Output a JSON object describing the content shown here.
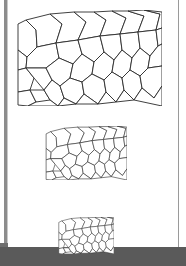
{
  "document": {
    "title": "Polygonal mesh at three resolutions",
    "background_color": "#ffffff",
    "ink_color": "#2a2a2a",
    "page_width": 186,
    "page_height": 266
  },
  "scan_artifacts": {
    "left_edge_label": "scan-left-dark-edge",
    "left_edge_color": "#8c8c8c",
    "right_edge_label": "scan-right-thin-line",
    "right_edge_color": "#9a9a9a",
    "bottom_band_label": "scan-bottom-dark-band",
    "bottom_band_color": "#5a5a5a"
  },
  "figures": [
    {
      "id": "fig-large",
      "name": "mesh-large",
      "scale_percent": 100,
      "x": 16,
      "y": 10,
      "width": 146,
      "height": 96,
      "stroke_width": 0.9,
      "stroke_color": "#2a2a2a",
      "fill_color": "#ffffff"
    },
    {
      "id": "fig-medium",
      "name": "mesh-medium",
      "scale_percent": 56,
      "x": 45,
      "y": 126,
      "width": 82,
      "height": 54,
      "stroke_width": 0.6,
      "stroke_color": "#4a4a4a",
      "fill_color": "#ffffff"
    },
    {
      "id": "fig-small",
      "name": "mesh-small",
      "scale_percent": 38,
      "x": 58,
      "y": 217,
      "width": 56,
      "height": 37,
      "stroke_width": 0.5,
      "stroke_color": "#5a5a5a",
      "fill_color": "#ffffff"
    }
  ],
  "chart_data": {
    "type": "diagram",
    "domain_extent": [
      0,
      146,
      0,
      96
    ],
    "polygon_count": 38,
    "polygons": [
      [
        [
          2,
          14
        ],
        [
          2,
          40
        ],
        [
          11,
          47
        ],
        [
          21,
          37
        ],
        [
          20,
          20
        ],
        [
          10,
          10
        ]
      ],
      [
        [
          10,
          10
        ],
        [
          20,
          20
        ],
        [
          21,
          37
        ],
        [
          40,
          33
        ],
        [
          46,
          14
        ],
        [
          34,
          4
        ]
      ],
      [
        [
          34,
          4
        ],
        [
          46,
          14
        ],
        [
          40,
          33
        ],
        [
          62,
          30
        ],
        [
          70,
          12
        ],
        [
          58,
          2
        ]
      ],
      [
        [
          58,
          2
        ],
        [
          70,
          12
        ],
        [
          62,
          30
        ],
        [
          84,
          26
        ],
        [
          90,
          10
        ],
        [
          78,
          2
        ]
      ],
      [
        [
          78,
          2
        ],
        [
          90,
          10
        ],
        [
          84,
          26
        ],
        [
          104,
          24
        ],
        [
          110,
          8
        ],
        [
          96,
          1
        ]
      ],
      [
        [
          96,
          1
        ],
        [
          110,
          8
        ],
        [
          104,
          24
        ],
        [
          122,
          22
        ],
        [
          128,
          6
        ],
        [
          112,
          1
        ]
      ],
      [
        [
          112,
          1
        ],
        [
          128,
          6
        ],
        [
          122,
          22
        ],
        [
          140,
          20
        ],
        [
          144,
          4
        ],
        [
          128,
          0
        ]
      ],
      [
        [
          128,
          0
        ],
        [
          144,
          4
        ],
        [
          140,
          20
        ],
        [
          146,
          18
        ],
        [
          146,
          2
        ]
      ],
      [
        [
          2,
          40
        ],
        [
          11,
          47
        ],
        [
          10,
          58
        ],
        [
          2,
          60
        ]
      ],
      [
        [
          11,
          47
        ],
        [
          21,
          37
        ],
        [
          40,
          33
        ],
        [
          43,
          48
        ],
        [
          30,
          58
        ],
        [
          10,
          58
        ]
      ],
      [
        [
          40,
          33
        ],
        [
          62,
          30
        ],
        [
          66,
          44
        ],
        [
          57,
          54
        ],
        [
          43,
          48
        ]
      ],
      [
        [
          62,
          30
        ],
        [
          84,
          26
        ],
        [
          88,
          42
        ],
        [
          78,
          52
        ],
        [
          66,
          44
        ]
      ],
      [
        [
          84,
          26
        ],
        [
          104,
          24
        ],
        [
          106,
          40
        ],
        [
          98,
          50
        ],
        [
          88,
          42
        ]
      ],
      [
        [
          104,
          24
        ],
        [
          122,
          22
        ],
        [
          124,
          38
        ],
        [
          116,
          48
        ],
        [
          106,
          40
        ]
      ],
      [
        [
          122,
          22
        ],
        [
          140,
          20
        ],
        [
          142,
          36
        ],
        [
          134,
          46
        ],
        [
          124,
          38
        ]
      ],
      [
        [
          140,
          20
        ],
        [
          146,
          18
        ],
        [
          146,
          34
        ],
        [
          142,
          36
        ]
      ],
      [
        [
          2,
          60
        ],
        [
          10,
          58
        ],
        [
          18,
          68
        ],
        [
          14,
          80
        ],
        [
          2,
          82
        ]
      ],
      [
        [
          10,
          58
        ],
        [
          30,
          58
        ],
        [
          36,
          70
        ],
        [
          28,
          80
        ],
        [
          18,
          68
        ]
      ],
      [
        [
          30,
          58
        ],
        [
          43,
          48
        ],
        [
          57,
          54
        ],
        [
          54,
          68
        ],
        [
          44,
          76
        ],
        [
          36,
          70
        ]
      ],
      [
        [
          57,
          54
        ],
        [
          66,
          44
        ],
        [
          78,
          52
        ],
        [
          76,
          64
        ],
        [
          66,
          72
        ],
        [
          54,
          68
        ]
      ],
      [
        [
          78,
          52
        ],
        [
          88,
          42
        ],
        [
          98,
          50
        ],
        [
          96,
          62
        ],
        [
          88,
          70
        ],
        [
          76,
          64
        ]
      ],
      [
        [
          98,
          50
        ],
        [
          106,
          40
        ],
        [
          116,
          48
        ],
        [
          114,
          60
        ],
        [
          106,
          68
        ],
        [
          96,
          62
        ]
      ],
      [
        [
          116,
          48
        ],
        [
          124,
          38
        ],
        [
          134,
          46
        ],
        [
          132,
          58
        ],
        [
          124,
          66
        ],
        [
          114,
          60
        ]
      ],
      [
        [
          134,
          46
        ],
        [
          142,
          36
        ],
        [
          146,
          34
        ],
        [
          146,
          56
        ],
        [
          132,
          58
        ]
      ],
      [
        [
          2,
          82
        ],
        [
          14,
          80
        ],
        [
          20,
          92
        ],
        [
          12,
          96
        ],
        [
          2,
          95
        ]
      ],
      [
        [
          14,
          80
        ],
        [
          28,
          80
        ],
        [
          34,
          90
        ],
        [
          28,
          96
        ],
        [
          20,
          92
        ]
      ],
      [
        [
          28,
          80
        ],
        [
          36,
          70
        ],
        [
          44,
          76
        ],
        [
          48,
          88
        ],
        [
          42,
          96
        ],
        [
          34,
          90
        ]
      ],
      [
        [
          44,
          76
        ],
        [
          54,
          68
        ],
        [
          66,
          72
        ],
        [
          68,
          84
        ],
        [
          60,
          94
        ],
        [
          48,
          88
        ]
      ],
      [
        [
          66,
          72
        ],
        [
          76,
          64
        ],
        [
          88,
          70
        ],
        [
          90,
          82
        ],
        [
          82,
          94
        ],
        [
          68,
          84
        ]
      ],
      [
        [
          88,
          70
        ],
        [
          96,
          62
        ],
        [
          106,
          68
        ],
        [
          108,
          80
        ],
        [
          100,
          92
        ],
        [
          90,
          82
        ]
      ],
      [
        [
          106,
          68
        ],
        [
          114,
          60
        ],
        [
          124,
          66
        ],
        [
          126,
          78
        ],
        [
          118,
          90
        ],
        [
          108,
          80
        ]
      ],
      [
        [
          124,
          66
        ],
        [
          132,
          58
        ],
        [
          146,
          56
        ],
        [
          146,
          76
        ],
        [
          138,
          88
        ],
        [
          126,
          78
        ]
      ],
      [
        [
          12,
          96
        ],
        [
          20,
          92
        ],
        [
          34,
          90
        ],
        [
          42,
          96
        ]
      ],
      [
        [
          42,
          96
        ],
        [
          48,
          88
        ],
        [
          60,
          94
        ]
      ],
      [
        [
          60,
          94
        ],
        [
          68,
          84
        ],
        [
          82,
          94
        ]
      ],
      [
        [
          82,
          94
        ],
        [
          90,
          82
        ],
        [
          100,
          92
        ]
      ],
      [
        [
          100,
          92
        ],
        [
          108,
          80
        ],
        [
          118,
          90
        ]
      ],
      [
        [
          118,
          90
        ],
        [
          126,
          78
        ],
        [
          138,
          88
        ],
        [
          146,
          76
        ],
        [
          146,
          96
        ]
      ]
    ]
  }
}
